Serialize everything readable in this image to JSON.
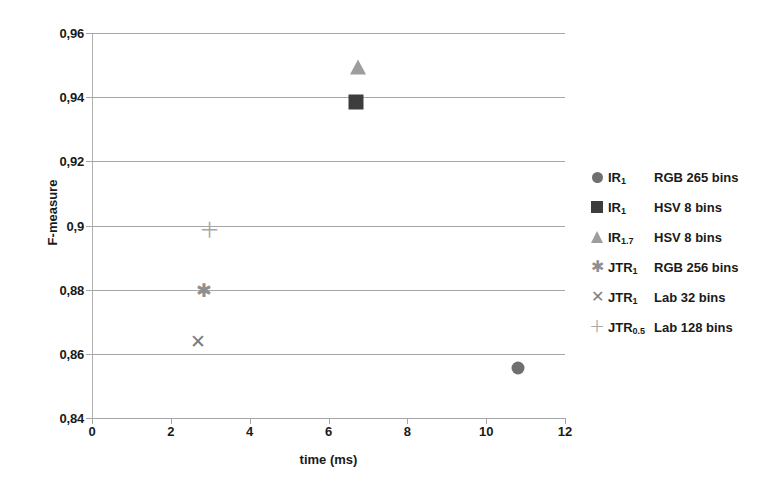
{
  "chart_data": {
    "type": "scatter",
    "title": "",
    "xlabel": "time (ms)",
    "ylabel": "F-measure",
    "xlim": [
      0,
      12
    ],
    "ylim": [
      0.84,
      0.96
    ],
    "x_ticks": [
      "0",
      "2",
      "4",
      "6",
      "8",
      "10",
      "12"
    ],
    "x_tick_values": [
      0,
      2,
      4,
      6,
      8,
      10,
      12
    ],
    "y_ticks": [
      "0,84",
      "0,86",
      "0,88",
      "0,9",
      "0,92",
      "0,94",
      "0,96"
    ],
    "y_tick_values": [
      0.84,
      0.86,
      0.88,
      0.9,
      0.92,
      0.94,
      0.96
    ],
    "grid": "horizontal",
    "legend_position": "right",
    "decimal_separator": ",",
    "series": [
      {
        "name": "IR_1 RGB 265 bins",
        "key": "IR",
        "key_sub": "1",
        "desc": "RGB 265 bins",
        "marker": "circle-filled",
        "color": "#6f6f6f",
        "x": 10.8,
        "y": 0.8557
      },
      {
        "name": "IR_1 HSV 8 bins",
        "key": "IR",
        "key_sub": "1",
        "desc": "HSV 8 bins",
        "marker": "square-filled",
        "color": "#3d3d3d",
        "x": 6.7,
        "y": 0.9385
      },
      {
        "name": "IR_1.7 HSV 8 bins",
        "key": "IR",
        "key_sub": "1.7",
        "desc": "HSV 8 bins",
        "marker": "triangle-filled",
        "color": "#9d9d9d",
        "x": 6.75,
        "y": 0.9495
      },
      {
        "name": "JTR_1 RGB 256 bins",
        "key": "JTR",
        "key_sub": "1",
        "desc": "RGB 256 bins",
        "marker": "asterisk",
        "color": "#8f8f8f",
        "x": 2.85,
        "y": 0.88
      },
      {
        "name": "JTR_1 Lab 32 bins",
        "key": "JTR",
        "key_sub": "1",
        "desc": "Lab 32 bins",
        "marker": "cross",
        "color": "#7d7d7d",
        "x": 2.7,
        "y": 0.864
      },
      {
        "name": "JTR_0.5 Lab 128 bins",
        "key": "JTR",
        "key_sub": "0.5",
        "desc": "Lab 128 bins",
        "marker": "plus",
        "color": "#a8a8a8",
        "x": 2.97,
        "y": 0.899
      }
    ]
  },
  "axes": {
    "y_title": "F-measure",
    "x_title": "time (ms)"
  }
}
